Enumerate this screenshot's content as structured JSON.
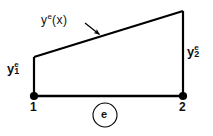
{
  "figure": {
    "type": "finite-element-diagram",
    "background_color": "#ffffff",
    "stroke_color": "#000000"
  },
  "labels": {
    "field_function": {
      "base": "y",
      "superscript": "e",
      "argument": "(x)",
      "text": "yᵉ(x)"
    },
    "node1_value": {
      "base": "y",
      "superscript": "e",
      "subscript": "1",
      "text": "yᵉ₁"
    },
    "node2_value": {
      "base": "y",
      "superscript": "e",
      "subscript": "2",
      "text": "yᵉ₂"
    },
    "node1_number": "1",
    "node2_number": "2",
    "element_tag": "e"
  },
  "geometry": {
    "node1": {
      "x": 34,
      "y": 96,
      "radius": 4
    },
    "node2": {
      "x": 183,
      "y": 96,
      "radius": 4
    },
    "left_vertical": {
      "x": 34,
      "y_top": 57,
      "y_bottom": 96
    },
    "right_vertical": {
      "x": 183,
      "y_top": 11,
      "y_bottom": 96
    },
    "base_line": {
      "x1": 34,
      "y1": 96,
      "x2": 183,
      "y2": 96
    },
    "slanted_line": {
      "x1": 34,
      "y1": 57,
      "x2": 183,
      "y2": 11
    },
    "leader_arrow": {
      "x1": 85,
      "y1": 23,
      "x2": 101,
      "y2": 36
    },
    "element_circle": {
      "cx": 105,
      "cy": 115,
      "r": 12
    }
  },
  "icons": {
    "node_marker": "filled-circle-node-icon",
    "leader_arrow": "arrow-pointer-icon",
    "element_circle": "circle-outline-icon"
  }
}
